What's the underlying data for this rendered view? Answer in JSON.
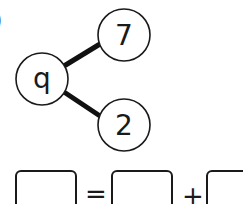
{
  "question": {
    "number_fragment": ")"
  },
  "part_whole": {
    "whole": {
      "label": "q",
      "cx": 42,
      "cy": 79
    },
    "parts": [
      {
        "label": "7",
        "cx": 124,
        "cy": 35
      },
      {
        "label": "2",
        "cx": 124,
        "cy": 125
      }
    ],
    "circle_radius": 26,
    "line_color": "#111111"
  },
  "number_sentence": {
    "equals_symbol": "=",
    "plus_symbol": "+",
    "boxes": [
      "",
      "",
      ""
    ]
  }
}
